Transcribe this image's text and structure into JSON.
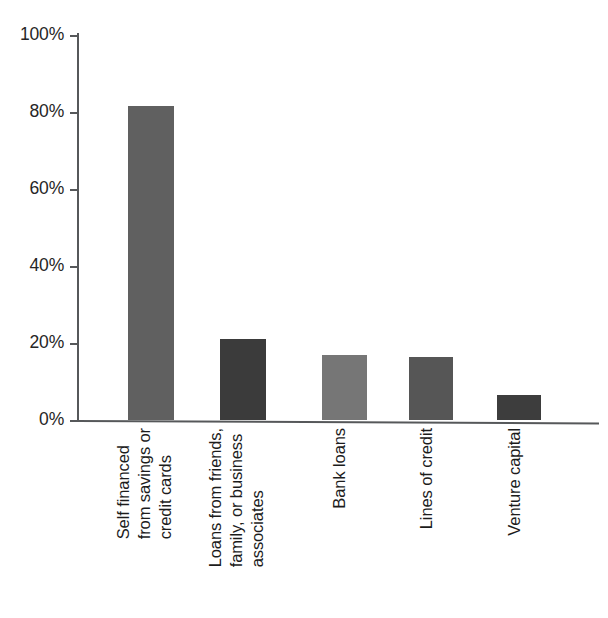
{
  "chart_data": {
    "type": "bar",
    "title": "",
    "subtitle": "",
    "xlabel": "",
    "ylabel": "",
    "categories": [
      "Self financed\nfrom savings or\ncredit cards",
      "Loans from friends,\nfamily, or business\nassociates",
      "Bank loans",
      "Lines of credit",
      "Venture capital"
    ],
    "values": [
      81.5,
      21,
      17,
      16.3,
      6.5
    ],
    "value_labels": [
      "81.5%",
      "21%",
      "17%",
      "16.3%",
      "6.5%"
    ],
    "bar_colors": [
      "#606060",
      "#3b3b3b",
      "#767676",
      "#565656",
      "#3d3d3d"
    ],
    "ylim": [
      0,
      100
    ],
    "yticks": [
      0,
      20,
      40,
      60,
      80,
      100
    ],
    "ytick_labels": [
      "0%",
      "20%",
      "40%",
      "60%",
      "80%",
      "100%"
    ],
    "grid": false,
    "legend": false,
    "legend_position": "none",
    "axis_color": "#56585a",
    "background_color": "#ffffff",
    "orientation": "vertical",
    "category_label_rotation": -90
  }
}
